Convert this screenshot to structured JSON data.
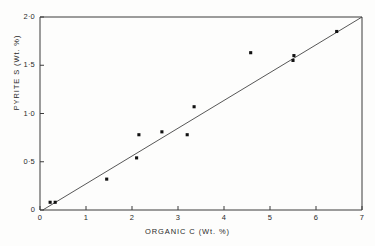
{
  "chart_data": {
    "type": "scatter",
    "title": "",
    "xlabel": "ORGANIC  C  (Wt. %)",
    "ylabel": "PYRITE  S  (Wt. %)",
    "xlim": [
      0,
      7
    ],
    "ylim": [
      0,
      2.0
    ],
    "grid": false,
    "legend": null,
    "x_ticks": [
      {
        "value": 0,
        "label": "0"
      },
      {
        "value": 1,
        "label": "1"
      },
      {
        "value": 2,
        "label": "2"
      },
      {
        "value": 3,
        "label": "3"
      },
      {
        "value": 4,
        "label": "4"
      },
      {
        "value": 5,
        "label": "5"
      },
      {
        "value": 6,
        "label": "6"
      },
      {
        "value": 7,
        "label": "7"
      }
    ],
    "y_ticks": [
      {
        "value": 0,
        "label": "0"
      },
      {
        "value": 0.5,
        "label": "0·5"
      },
      {
        "value": 1.0,
        "label": "1·0"
      },
      {
        "value": 1.5,
        "label": "1·5"
      },
      {
        "value": 2.0,
        "label": "2·0"
      }
    ],
    "series": [
      {
        "name": "samples",
        "marker": "square",
        "color": "#111111",
        "points": [
          {
            "x": 0.22,
            "y": 0.08
          },
          {
            "x": 0.33,
            "y": 0.08
          },
          {
            "x": 1.45,
            "y": 0.32
          },
          {
            "x": 2.1,
            "y": 0.54
          },
          {
            "x": 2.15,
            "y": 0.78
          },
          {
            "x": 2.65,
            "y": 0.81
          },
          {
            "x": 3.2,
            "y": 0.78
          },
          {
            "x": 3.35,
            "y": 1.07
          },
          {
            "x": 4.58,
            "y": 1.63
          },
          {
            "x": 5.5,
            "y": 1.55
          },
          {
            "x": 5.52,
            "y": 1.6
          },
          {
            "x": 6.45,
            "y": 1.85
          }
        ]
      }
    ],
    "fit_line": {
      "name": "regression-line",
      "color": "#444444",
      "x0": 0.06,
      "y0": 0.0,
      "x1": 7.0,
      "y1": 2.0
    }
  }
}
